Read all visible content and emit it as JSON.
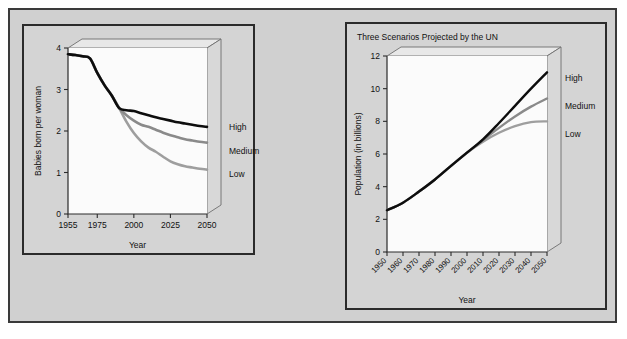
{
  "figure": {
    "background_color": "#d0d0d0",
    "frame_color": "#2b2b2b",
    "panel_background": "#d4d4d4",
    "plot_background": "#fbfbfb"
  },
  "colors": {
    "high_line": "#0d0d0d",
    "medium_line": "#8a8a8a",
    "low_line": "#9e9e9e",
    "box_face": "#e8e8e8",
    "box_side": "#d8d8d8",
    "axis": "#2b2b2b"
  },
  "left_panel": {
    "legend": {
      "high": "High",
      "medium": "Medium",
      "low": "Low"
    }
  },
  "right_panel": {
    "title": "Three Scenarios Projected by the UN",
    "legend": {
      "high": "High",
      "medium": "Medium",
      "low": "Low"
    }
  },
  "chart_data": [
    {
      "id": "fertility",
      "type": "line",
      "title": "",
      "xlabel": "Year",
      "ylabel": "Babies born per woman",
      "xlim": [
        1955,
        2050
      ],
      "ylim": [
        0,
        4
      ],
      "xticks": [
        1955,
        1975,
        2000,
        2025,
        2050
      ],
      "xtick_labels": [
        "1955",
        "1975",
        "2000",
        "2025",
        "2050"
      ],
      "yticks": [
        0,
        1,
        2,
        3,
        4
      ],
      "ytick_labels": [
        "0",
        "1",
        "2",
        "3",
        "4"
      ],
      "grid": false,
      "legend_position": "right-outside",
      "series": [
        {
          "name": "High",
          "color": "#0d0d0d",
          "x": [
            1955,
            1960,
            1965,
            1970,
            1975,
            1980,
            1985,
            1990,
            1995,
            2000,
            2005,
            2010,
            2015,
            2020,
            2025,
            2030,
            2035,
            2040,
            2045,
            2050
          ],
          "y": [
            3.85,
            3.83,
            3.8,
            3.75,
            3.4,
            3.1,
            2.85,
            2.55,
            2.5,
            2.48,
            2.43,
            2.38,
            2.33,
            2.29,
            2.25,
            2.21,
            2.18,
            2.15,
            2.12,
            2.1
          ]
        },
        {
          "name": "Medium",
          "color": "#8a8a8a",
          "x": [
            1955,
            1960,
            1965,
            1970,
            1975,
            1980,
            1985,
            1990,
            1995,
            2000,
            2005,
            2010,
            2015,
            2020,
            2025,
            2030,
            2035,
            2040,
            2045,
            2050
          ],
          "y": [
            3.85,
            3.83,
            3.8,
            3.75,
            3.4,
            3.1,
            2.85,
            2.55,
            2.38,
            2.25,
            2.15,
            2.1,
            2.03,
            1.96,
            1.9,
            1.85,
            1.8,
            1.77,
            1.74,
            1.72
          ]
        },
        {
          "name": "Low",
          "color": "#9e9e9e",
          "x": [
            1955,
            1960,
            1965,
            1970,
            1975,
            1980,
            1985,
            1990,
            1995,
            2000,
            2005,
            2010,
            2015,
            2020,
            2025,
            2030,
            2035,
            2040,
            2045,
            2050
          ],
          "y": [
            3.85,
            3.83,
            3.8,
            3.75,
            3.4,
            3.1,
            2.85,
            2.55,
            2.22,
            1.95,
            1.75,
            1.6,
            1.5,
            1.38,
            1.27,
            1.2,
            1.15,
            1.12,
            1.09,
            1.07
          ]
        }
      ]
    },
    {
      "id": "population",
      "type": "line",
      "title": "Three Scenarios Projected by the UN",
      "xlabel": "Year",
      "ylabel": "Population (in billions)",
      "xlim": [
        1950,
        2050
      ],
      "ylim": [
        0,
        12
      ],
      "xticks": [
        1950,
        1960,
        1970,
        1980,
        1990,
        2000,
        2010,
        2020,
        2030,
        2040,
        2050
      ],
      "xtick_labels": [
        "1950",
        "1960",
        "1970",
        "1980",
        "1990",
        "2000",
        "2010",
        "2020",
        "2030",
        "2040",
        "2050"
      ],
      "yticks": [
        0,
        2,
        4,
        6,
        8,
        10,
        12
      ],
      "ytick_labels": [
        "0",
        "2",
        "4",
        "6",
        "8",
        "10",
        "12"
      ],
      "grid": false,
      "legend_position": "right-outside",
      "series": [
        {
          "name": "High",
          "color": "#0d0d0d",
          "x": [
            1950,
            1960,
            1970,
            1980,
            1990,
            2000,
            2010,
            2020,
            2030,
            2040,
            2050
          ],
          "y": [
            2.55,
            3.02,
            3.7,
            4.44,
            5.27,
            6.08,
            6.9,
            7.9,
            8.95,
            10.0,
            11.0
          ]
        },
        {
          "name": "Medium",
          "color": "#8a8a8a",
          "x": [
            1950,
            1960,
            1970,
            1980,
            1990,
            2000,
            2010,
            2020,
            2030,
            2040,
            2050
          ],
          "y": [
            2.55,
            3.02,
            3.7,
            4.44,
            5.27,
            6.08,
            6.85,
            7.6,
            8.3,
            8.9,
            9.4
          ]
        },
        {
          "name": "Low",
          "color": "#9e9e9e",
          "x": [
            1950,
            1960,
            1970,
            1980,
            1990,
            2000,
            2010,
            2020,
            2030,
            2040,
            2050
          ],
          "y": [
            2.55,
            3.02,
            3.7,
            4.44,
            5.27,
            6.08,
            6.75,
            7.3,
            7.7,
            7.95,
            8.0
          ]
        }
      ]
    }
  ]
}
